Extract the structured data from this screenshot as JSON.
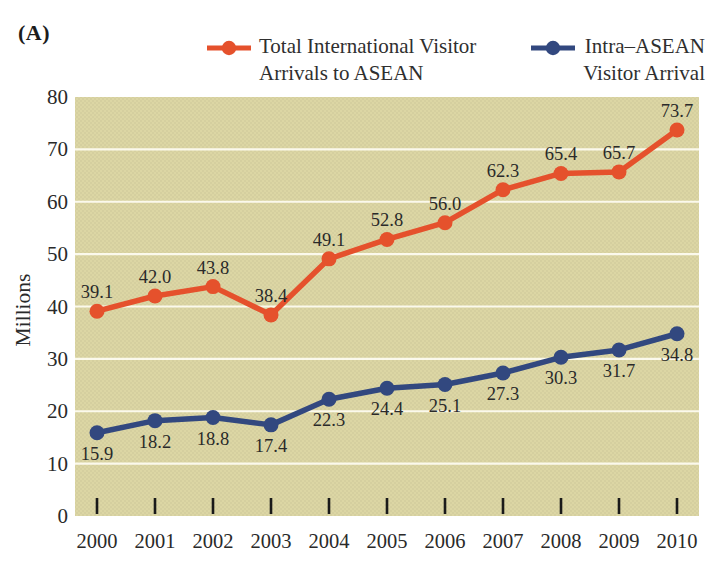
{
  "panel_label": "(A)",
  "colors": {
    "plot_background": "#dcd6a4",
    "gridline": "#fbf9ec",
    "series_total": "#e5512c",
    "series_intra": "#32487f",
    "text": "#2a2a2a",
    "tick": "#1a1a1a"
  },
  "legend": {
    "entries": [
      {
        "label": "Total International Visitor\nArrivals to ASEAN",
        "color": "#e5512c",
        "align": "left"
      },
      {
        "label": "Intra–ASEAN\nVisitor Arrival",
        "color": "#32487f",
        "align": "right"
      }
    ]
  },
  "chart_data": {
    "type": "line",
    "categories": [
      "2000",
      "2001",
      "2002",
      "2003",
      "2004",
      "2005",
      "2006",
      "2007",
      "2008",
      "2009",
      "2010"
    ],
    "series": [
      {
        "name": "Total International Visitor Arrivals to ASEAN",
        "color": "#e5512c",
        "values": [
          39.1,
          42.0,
          43.8,
          38.4,
          49.1,
          52.8,
          56.0,
          62.3,
          65.4,
          65.7,
          73.7
        ],
        "label_position": "above"
      },
      {
        "name": "Intra–ASEAN Visitor Arrival",
        "color": "#32487f",
        "values": [
          15.9,
          18.2,
          18.8,
          17.4,
          22.3,
          24.4,
          25.1,
          27.3,
          30.3,
          31.7,
          34.8
        ],
        "label_position": "below"
      }
    ],
    "xlabel": "",
    "ylabel": "Millions",
    "ylim": [
      0,
      80
    ],
    "ytick_step": 10,
    "grid": true,
    "legend_position": "top"
  }
}
